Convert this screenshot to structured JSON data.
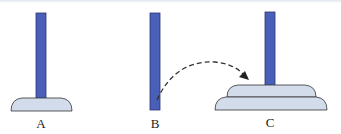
{
  "diagram": {
    "type": "tower-of-hanoi",
    "colors": {
      "peg": "#4a5fb8",
      "peg_stroke": "#2a3570",
      "disk": "#d2dceb",
      "disk_stroke": "#333333",
      "arrow": "#333333"
    },
    "pegs": [
      {
        "id": "A",
        "label": "A",
        "disks": 1
      },
      {
        "id": "B",
        "label": "B",
        "disks": 0
      },
      {
        "id": "C",
        "label": "C",
        "disks": 2
      }
    ],
    "arrow": {
      "from": "B",
      "to": "C",
      "style": "dashed"
    }
  }
}
